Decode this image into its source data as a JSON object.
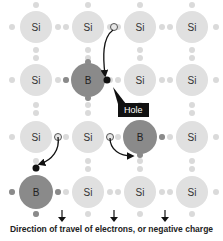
{
  "diagram": {
    "lattice": {
      "columns_x": [
        36,
        88,
        140,
        192
      ],
      "rows_y": [
        27,
        80,
        137,
        192
      ],
      "atoms": [
        {
          "label": "Si",
          "type": "si",
          "col": 0,
          "row": 0
        },
        {
          "label": "Si",
          "type": "si",
          "col": 1,
          "row": 0
        },
        {
          "label": "Si",
          "type": "si",
          "col": 2,
          "row": 0
        },
        {
          "label": "Si",
          "type": "si",
          "col": 3,
          "row": 0
        },
        {
          "label": "Si",
          "type": "si",
          "col": 0,
          "row": 1
        },
        {
          "label": "B",
          "type": "b",
          "col": 1,
          "row": 1
        },
        {
          "label": "Si",
          "type": "si",
          "col": 2,
          "row": 1
        },
        {
          "label": "Si",
          "type": "si",
          "col": 3,
          "row": 1
        },
        {
          "label": "Si",
          "type": "si",
          "col": 0,
          "row": 2
        },
        {
          "label": "Si",
          "type": "si",
          "col": 1,
          "row": 2
        },
        {
          "label": "B",
          "type": "b",
          "col": 2,
          "row": 2
        },
        {
          "label": "Si",
          "type": "si",
          "col": 3,
          "row": 2
        },
        {
          "label": "B",
          "type": "b",
          "col": 0,
          "row": 3
        },
        {
          "label": "Si",
          "type": "si",
          "col": 1,
          "row": 3
        },
        {
          "label": "Si",
          "type": "si",
          "col": 2,
          "row": 3
        },
        {
          "label": "Si",
          "type": "si",
          "col": 3,
          "row": 3
        }
      ]
    },
    "hole_label": "Hole",
    "caption": "Direction of travel of electrons, or negative charge",
    "colors": {
      "silicon": "#e0e0e0",
      "boron": "#8a8a8a",
      "electron_light": "#dadada",
      "electron_dark": "#8a8a8a",
      "hole": "#111111",
      "arrow": "#111111"
    }
  }
}
